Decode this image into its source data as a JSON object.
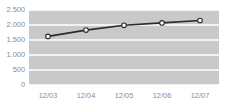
{
  "chart_data": {
    "type": "line",
    "title": "",
    "xlabel": "",
    "ylabel": "",
    "categories": [
      "12/03",
      "12/04",
      "12/05",
      "12/06",
      "12/07"
    ],
    "series": [
      {
        "name": "series-1",
        "values": [
          1620,
          1830,
          1990,
          2070,
          2150
        ]
      }
    ],
    "ylim": [
      0,
      2500
    ],
    "ytick_values": [
      0,
      500,
      1000,
      1500,
      2000,
      2500
    ],
    "ytick_labels": [
      "0",
      "500",
      "1.000",
      "1.500",
      "2.000",
      "2.500"
    ],
    "grid": true,
    "grid_orientation": "horizontal",
    "legend": "none",
    "colors": {
      "plot_background": "#c9c9c9",
      "gridline": "#ffffff",
      "line": "#2b2b2b",
      "marker_fill": "#ffffff",
      "marker_stroke": "#2b2b2b",
      "tick_text": "#8c8c8c",
      "page_background": "#ffffff"
    }
  }
}
